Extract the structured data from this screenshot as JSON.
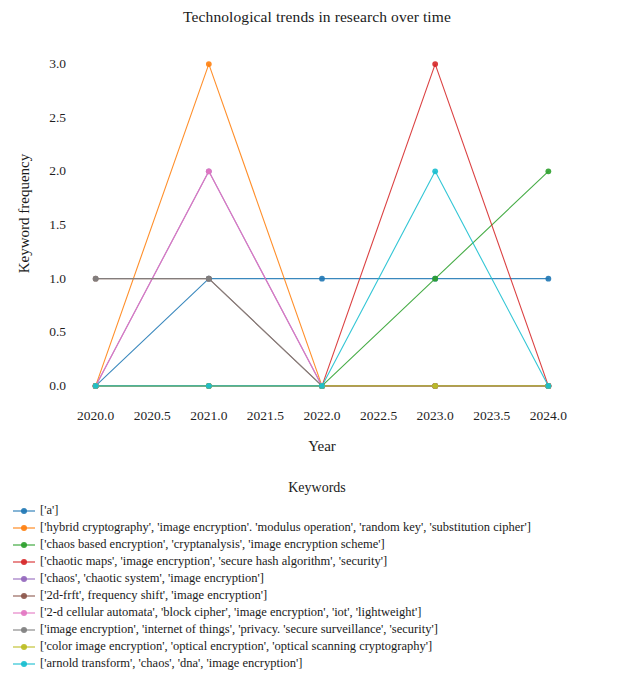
{
  "chart_data": {
    "type": "line",
    "title": "Technological trends in research over time",
    "xlabel": "Year",
    "ylabel": "Keyword frequency",
    "x": [
      2020,
      2021,
      2022,
      2023,
      2024
    ],
    "xlim": [
      2019.8,
      2024.2
    ],
    "ylim": [
      -0.15,
      3.15
    ],
    "xticks": [
      "2020.0",
      "2020.5",
      "2021.0",
      "2021.5",
      "2022.0",
      "2022.5",
      "2023.0",
      "2023.5",
      "2024.0"
    ],
    "xtick_values": [
      2020.0,
      2020.5,
      2021.0,
      2021.5,
      2022.0,
      2022.5,
      2023.0,
      2023.5,
      2024.0
    ],
    "yticks": [
      "0.0",
      "0.5",
      "1.0",
      "1.5",
      "2.0",
      "2.5",
      "3.0"
    ],
    "ytick_values": [
      0.0,
      0.5,
      1.0,
      1.5,
      2.0,
      2.5,
      3.0
    ],
    "grid": false,
    "legend_position": "below",
    "legend_title": "Keywords",
    "marker": "circle",
    "series": [
      {
        "name": "['a']",
        "color": "#1f77b4",
        "values": [
          0,
          1,
          1,
          1,
          1
        ]
      },
      {
        "name": "['hybrid cryptography', 'image encryption'. 'modulus operation', 'random key', 'substitution cipher']",
        "color": "#ff7f0e",
        "values": [
          0,
          3,
          0,
          0,
          0
        ]
      },
      {
        "name": "['chaos based encryption', 'cryptanalysis', 'image encryption scheme']",
        "color": "#2ca02c",
        "values": [
          0,
          0,
          0,
          1,
          2
        ]
      },
      {
        "name": "['chaotic maps', 'image encryption', 'secure hash algorithm', 'security']",
        "color": "#d62728",
        "values": [
          0,
          0,
          0,
          3,
          0
        ]
      },
      {
        "name": "['chaos', 'chaotic system', 'image encryption']",
        "color": "#9467bd",
        "values": [
          0,
          2,
          0,
          0,
          0
        ]
      },
      {
        "name": "['2d-frft', frequency shift', 'image encryption']",
        "color": "#8c564b",
        "values": [
          1,
          1,
          0,
          0,
          0
        ]
      },
      {
        "name": "['2-d cellular automata', 'block cipher', 'image encryption', 'iot', 'lightweight']",
        "color": "#e377c2",
        "values": [
          0,
          2,
          0,
          0,
          0
        ]
      },
      {
        "name": "['image encryption', 'internet of things', 'privacy. 'secure surveillance', 'security']",
        "color": "#7f7f7f",
        "values": [
          1,
          1,
          0,
          0,
          0
        ]
      },
      {
        "name": "['color image encryption', 'optical encryption', 'optical scanning cryptography']",
        "color": "#bcbd22",
        "values": [
          0,
          0,
          0,
          0,
          0
        ]
      },
      {
        "name": "['arnold transform', 'chaos', 'dna', 'image encryption']",
        "color": "#17becf",
        "values": [
          0,
          0,
          0,
          2,
          0
        ]
      }
    ]
  }
}
